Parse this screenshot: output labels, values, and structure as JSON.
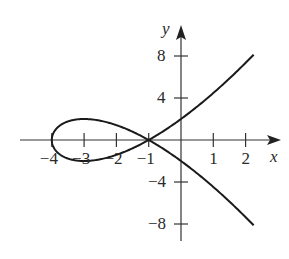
{
  "chart_data": {
    "type": "line",
    "title": "",
    "parametric": {
      "x": "t^2 - 4",
      "y": "t^3 - 3t",
      "t_range": [
        -2.5,
        2.5
      ]
    },
    "xlabel": "x",
    "ylabel": "y",
    "x_ticks": [
      -4,
      -3,
      -2,
      -1,
      1,
      2
    ],
    "x_tick_labels": [
      "−4",
      "−3",
      "−2",
      "−1",
      "1",
      "2"
    ],
    "y_ticks": [
      8,
      4,
      -4,
      -8
    ],
    "y_tick_labels": [
      "8",
      "4",
      "−4",
      "−8"
    ],
    "xlim": [
      -5,
      3
    ],
    "ylim": [
      -10,
      10
    ],
    "grid": false,
    "legend": null,
    "key_points": [
      {
        "x": -4,
        "y": 0,
        "note": "leftmost point of loop"
      },
      {
        "x": -1,
        "y": 0,
        "note": "self-intersection"
      },
      {
        "x": -3,
        "y": 2,
        "note": "loop top"
      },
      {
        "x": -3,
        "y": -2,
        "note": "loop bottom"
      },
      {
        "x": 0,
        "y": 2,
        "note": "upper branch y-intercept"
      },
      {
        "x": 0,
        "y": -2,
        "note": "lower branch y-intercept"
      },
      {
        "x": 2.25,
        "y": 8.1,
        "note": "upper branch end"
      },
      {
        "x": 2.25,
        "y": -8.1,
        "note": "lower branch end"
      }
    ],
    "colors": {
      "curve": "#1a1a1a",
      "axes": "#333333",
      "background": "#ffffff"
    }
  },
  "labels": {
    "x_axis": "x",
    "y_axis": "y",
    "xt": [
      "−4",
      "−3",
      "−2",
      "−1",
      "1",
      "2"
    ],
    "yt": [
      "8",
      "4",
      "−4",
      "−8"
    ]
  }
}
